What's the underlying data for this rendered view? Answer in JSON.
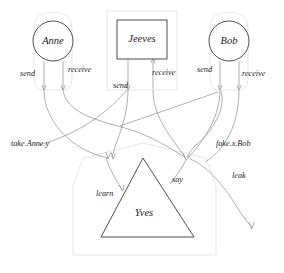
{
  "diagram": {
    "type": "process-interaction-diagram",
    "background_color": "#ffffff",
    "node_stroke_color": "#3a3a3a",
    "edge_stroke_color": "#8c8c8c",
    "boundary_stroke_color": "#e2e2e2",
    "label_color": "#1c1c1c",
    "nodes": [
      {
        "id": "anne",
        "label": "Anne",
        "shape": "circle",
        "cx": 53,
        "cy": 41,
        "r": 20
      },
      {
        "id": "jeeves",
        "label": "Jeeves",
        "shape": "rectangle",
        "x": 117,
        "y": 20,
        "w": 50,
        "h": 39
      },
      {
        "id": "bob",
        "label": "Bob",
        "shape": "circle",
        "cx": 229,
        "cy": 41,
        "r": 20
      },
      {
        "id": "yves",
        "label": "Yves",
        "shape": "triangle",
        "apex_x": 143,
        "apex_y": 158,
        "base_left_x": 101,
        "base_right_x": 194,
        "base_y": 237
      }
    ],
    "edge_labels": [
      {
        "id": "anne-send",
        "text": "send",
        "x": 20,
        "y": 76
      },
      {
        "id": "anne-receive",
        "text": "receive",
        "x": 68,
        "y": 72
      },
      {
        "id": "jeeves-send",
        "text": "send",
        "x": 113,
        "y": 88
      },
      {
        "id": "jeeves-receive",
        "text": "receive",
        "x": 152,
        "y": 75
      },
      {
        "id": "bob-send",
        "text": "send",
        "x": 197,
        "y": 72
      },
      {
        "id": "bob-receive",
        "text": "receive",
        "x": 242,
        "y": 76
      },
      {
        "id": "take-anne-y",
        "text": "take.Anne.y",
        "x": 11,
        "y": 146
      },
      {
        "id": "fake-x-bob",
        "text": "fake.x.Bob",
        "x": 216,
        "y": 146
      },
      {
        "id": "learn",
        "text": "learn",
        "x": 96,
        "y": 196
      },
      {
        "id": "say",
        "text": "say",
        "x": 172,
        "y": 182
      },
      {
        "id": "leak",
        "text": "leak",
        "x": 232,
        "y": 178
      }
    ]
  }
}
